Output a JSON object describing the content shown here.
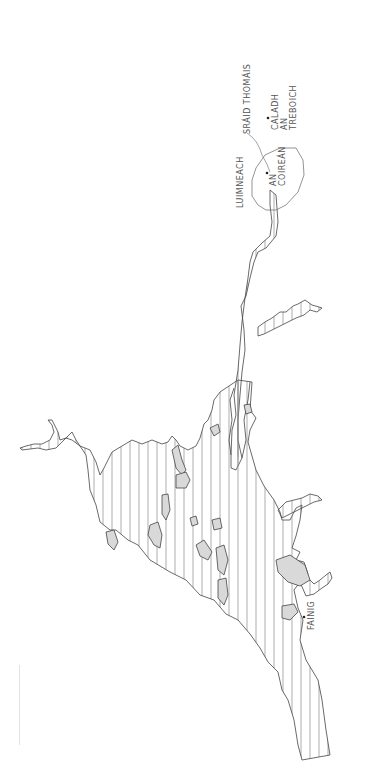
{
  "map": {
    "type": "hand-drawn sketch map, rotated 90°",
    "style": {
      "ink": "#444444",
      "water_hatch": "#8a8a8a",
      "island_fill": "#d9d9d9",
      "background": "#ffffff"
    },
    "labels": {
      "luimneach": "LUIMNEACH",
      "sraid_thomais": "SRÁID THOMÁIS",
      "an_coirean": "AN\nCOIREÁN",
      "caladh_an_treboich": "CALADH\nAN\nTREBOICH",
      "fainig": "FAINIG"
    },
    "points": [
      {
        "name": "an-coirean",
        "x": 267,
        "y": 173
      },
      {
        "name": "caladh-an-treboich",
        "x": 268,
        "y": 118
      },
      {
        "name": "fainig",
        "x": 304,
        "y": 617
      }
    ]
  }
}
